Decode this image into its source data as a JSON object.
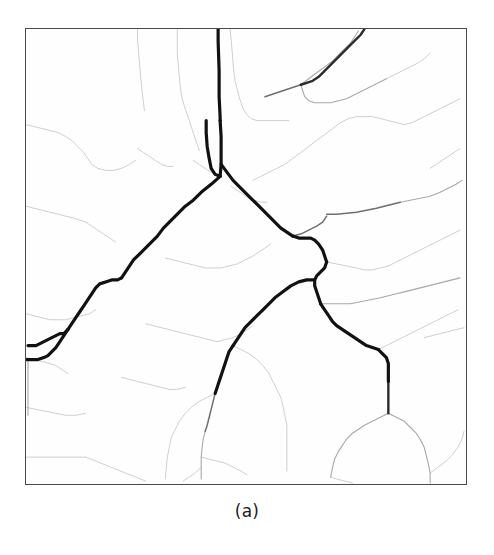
{
  "figure": {
    "caption": "(a)",
    "panel_label": "drainage-network-map",
    "background_color": "#ffffff",
    "panel_background_color": "#fefefe",
    "frame_color": "#4a4a4a",
    "frame": {
      "x": 25,
      "y": 28,
      "width": 442,
      "height": 457
    }
  },
  "chart_data": {
    "type": "diagram",
    "title": "",
    "subtitle": "",
    "xlabel": "",
    "ylabel": "",
    "grid": false,
    "legend": null,
    "viewbox": {
      "width": 442,
      "height": 457
    },
    "stroke_classes": [
      {
        "name": "trunk",
        "color": "#111111",
        "width": 3.2,
        "order": "main-channel"
      },
      {
        "name": "major",
        "color": "#2b2b2b",
        "width": 2.4,
        "order": "secondary-channel"
      },
      {
        "name": "medium",
        "color": "#6f6f6f",
        "width": 1.5,
        "order": "tertiary-channel"
      },
      {
        "name": "minor",
        "color": "#a8a8a8",
        "width": 1.1,
        "order": "minor-tributary"
      },
      {
        "name": "faint",
        "color": "#cfcfcf",
        "width": 1.0,
        "order": "first-order-tributary"
      }
    ],
    "channels": [
      {
        "id": "trunk-upper-inlet",
        "class": "trunk",
        "points": "193,0 193,12 194,42 194,68 195,88 195,92"
      },
      {
        "id": "trunk-upper-stem",
        "class": "trunk",
        "points": "195,92 196,108 196,122 196,136 195,148"
      },
      {
        "id": "trunk-left-spur",
        "class": "trunk",
        "points": "181,92 181,104 182,118 184,130 186,140 190,146 195,148"
      },
      {
        "id": "trunk-left-descent",
        "class": "trunk",
        "points": "195,148 186,156 176,164 168,172 160,178 152,186 144,194 138,200 132,208 126,214 120,220 114,226 108,232 104,238 100,244 96,250"
      },
      {
        "id": "trunk-left-step",
        "class": "trunk",
        "points": "96,250 92,252 86,252 80,254 74,256 70,260 66,266 62,272 58,278 54,284 50,290 46,296 42,302"
      },
      {
        "id": "trunk-left-mid",
        "class": "trunk",
        "points": "42,302 38,306 34,306 30,308 26,310 22,312 18,314 14,316 10,318 6,318 2,318"
      },
      {
        "id": "trunk-left-lower",
        "class": "trunk",
        "points": "42,302 38,308 34,314 30,320 26,324 22,328 18,330 12,332 6,332 1,332"
      },
      {
        "id": "trunk-outlet-edge",
        "class": "minor",
        "points": "2,332 2,344 2,356 2,368 2,378 2,388"
      },
      {
        "id": "trunk-right-descent",
        "class": "trunk",
        "points": "196,136 202,144 208,152 214,158 220,164 226,170 232,176 238,182 244,188 250,194 256,200 262,204 268,208"
      },
      {
        "id": "trunk-right-junction",
        "class": "trunk",
        "points": "268,208 274,210 280,210 286,210 290,212 294,216 298,222 300,228 302,234"
      },
      {
        "id": "trunk-center-knot",
        "class": "trunk",
        "points": "302,234 300,240 296,244 292,248 290,252 290,258 292,264 294,270 296,276"
      },
      {
        "id": "trunk-branch-southwest",
        "class": "trunk",
        "points": "290,252 282,252 274,254 266,258 258,264 250,270 244,276 238,282 232,288 226,294 220,300 216,306 212,312 208,318"
      },
      {
        "id": "trunk-branch-sw-lower",
        "class": "trunk",
        "points": "208,318 204,324 202,330 200,336 198,342 196,348 194,354 192,360 190,366"
      },
      {
        "id": "trunk-sw-fade",
        "class": "medium",
        "points": "190,366 188,374 186,382 184,390 182,398 180,404"
      },
      {
        "id": "trunk-sw-fade2",
        "class": "minor",
        "points": "180,404 178,412 177,420 176,430 176,440 176,452"
      },
      {
        "id": "trunk-branch-southeast",
        "class": "trunk",
        "points": "296,276 300,282 304,288 308,294 312,298 318,302 324,306 330,310 336,314 342,318 348,320 354,322"
      },
      {
        "id": "trunk-se-step",
        "class": "trunk",
        "points": "354,322 358,326 362,330 364,336 364,342 364,348 364,354"
      },
      {
        "id": "trunk-se-lower",
        "class": "major",
        "points": "364,354 364,362 364,370 364,378 364,386"
      },
      {
        "id": "se-fork-left",
        "class": "minor",
        "points": "364,386 356,390 348,394 340,398 334,402 328,406 322,412 318,418 314,424 310,432 308,440 306,450"
      },
      {
        "id": "se-fork-right",
        "class": "minor",
        "points": "364,386 372,390 380,394 386,400 392,406 396,412 400,420 402,428 404,436 406,446 406,456"
      },
      {
        "id": "ne-dark-inlet",
        "class": "major",
        "points": "340,0 336,6 330,12 324,18 318,24 312,30 306,36 300,42 294,48 288,52 282,54 276,56"
      },
      {
        "id": "ne-dark-continue",
        "class": "medium",
        "points": "276,56 270,58 264,60 258,62 252,64 246,66 240,68"
      },
      {
        "id": "ne-branch-up-right",
        "class": "minor",
        "points": "276,56 284,50 292,44 300,38 308,32 314,26 320,20 326,14 330,8 334,2"
      },
      {
        "id": "ne-branch-down",
        "class": "minor",
        "points": "276,56 278,62 280,68 284,72 290,74 298,74 306,74 314,72 322,70 330,66 338,62 346,58 354,54 362,50"
      },
      {
        "id": "ne-branch-far-right",
        "class": "faint",
        "points": "362,50 370,46 378,42 386,38 394,34 400,30 406,24"
      },
      {
        "id": "top-center-tributary",
        "class": "faint",
        "points": "205,0 206,10 207,22 208,34 209,44 210,52 212,60 214,68 216,74 218,80"
      },
      {
        "id": "top-center-trib2",
        "class": "faint",
        "points": "218,80 222,86 226,90 232,92 240,92 248,92 256,92 264,92"
      },
      {
        "id": "upper-left-trib-a",
        "class": "faint",
        "points": "152,0 152,12 152,24 153,36 154,48 155,58 156,66 158,74 160,80 162,86 164,92 166,98 168,104 170,110 172,116 174,122"
      },
      {
        "id": "upper-left-trib-b",
        "class": "faint",
        "points": "112,0 112,10 113,22 114,34 115,46 116,56 117,66 118,74 119,82"
      },
      {
        "id": "upper-left-trib-c",
        "class": "faint",
        "points": "0,96 8,98 16,100 24,102 32,104 40,108 46,112 52,118 58,124 62,130 66,136"
      },
      {
        "id": "upper-left-trib-d",
        "class": "faint",
        "points": "66,136 72,140 80,142 88,142 96,140 104,136 110,132"
      },
      {
        "id": "left-mid-trib-a",
        "class": "faint",
        "points": "0,178 8,180 16,182 24,184 32,186 40,188 48,190 54,192 60,194"
      },
      {
        "id": "left-mid-trib-b",
        "class": "faint",
        "points": "60,194 66,198 72,202 78,206 84,210 90,214"
      },
      {
        "id": "left-lower-trib-a",
        "class": "faint",
        "points": "0,286 8,288 16,290 24,292 32,292 40,292 48,290 56,288 64,286 70,282"
      },
      {
        "id": "left-lower-trib-b",
        "class": "faint",
        "points": "0,330 8,332 16,334 24,336 30,338 36,342 42,346"
      },
      {
        "id": "left-bottom-trib",
        "class": "faint",
        "points": "0,380 10,382 20,384 30,386 40,388 50,388 60,386"
      },
      {
        "id": "left-bottom-trib2",
        "class": "faint",
        "points": "0,430 12,430 24,430 36,430 48,430 60,430"
      },
      {
        "id": "center-trib-a",
        "class": "faint",
        "points": "112,120 118,124 124,128 130,132 136,136 142,138 148,138"
      },
      {
        "id": "center-trib-b",
        "class": "faint",
        "points": "168,132 174,136 180,140 186,144 192,146"
      },
      {
        "id": "center-trib-c",
        "class": "faint",
        "points": "206,158 212,162 218,166 224,170 230,172 236,174 242,174"
      },
      {
        "id": "center-trib-d",
        "class": "faint",
        "points": "140,230 148,232 156,234 164,236 172,238 180,240 188,240 196,240"
      },
      {
        "id": "center-trib-e",
        "class": "faint",
        "points": "196,240 204,238 212,236 220,232 228,228 234,224 240,220 246,216"
      },
      {
        "id": "center-bowl-a",
        "class": "faint",
        "points": "120,296 128,298 136,300 144,302 152,304 160,306 168,308 176,310 184,312 192,314"
      },
      {
        "id": "center-bowl-b",
        "class": "faint",
        "points": "192,314 200,312 208,310 216,306 222,302 228,298"
      },
      {
        "id": "center-lower-trib",
        "class": "faint",
        "points": "96,350 104,352 112,354 120,356 128,358 136,360 144,362 152,362 160,360"
      },
      {
        "id": "mid-right-horizontal-a",
        "class": "medium",
        "points": "302,186 312,186 322,185 332,184 342,182 352,180 360,178 368,176 376,174"
      },
      {
        "id": "mid-right-horizontal-b",
        "class": "minor",
        "points": "376,174 386,172 396,170 406,168 416,164 424,160 432,156 438,152"
      },
      {
        "id": "mid-right-horizontal-c",
        "class": "medium",
        "points": "268,208 276,206 284,202 292,198 298,194 302,188"
      },
      {
        "id": "mid-right-trib-a",
        "class": "faint",
        "points": "228,152 236,148 244,144 252,140 260,136 268,130 276,124 284,118 292,112 300,106 308,100 316,94"
      },
      {
        "id": "mid-right-trib-b",
        "class": "faint",
        "points": "316,94 324,90 332,88 340,88 348,88 356,90 364,92 372,94 380,96"
      },
      {
        "id": "mid-right-trib-c",
        "class": "faint",
        "points": "380,96 388,94 396,90 404,86 412,82 420,78 428,74 436,70"
      },
      {
        "id": "mid-right-trib-d",
        "class": "faint",
        "points": "302,234 312,236 322,238 332,240 340,242 348,242 356,240 364,238"
      },
      {
        "id": "mid-right-trib-e",
        "class": "faint",
        "points": "364,238 372,234 380,230 388,226 396,222 404,218 412,214 420,210 428,206 436,202"
      },
      {
        "id": "right-trib-horizontal",
        "class": "minor",
        "points": "296,276 306,276 316,276 326,276 336,274 346,272 356,270 364,268 372,266 380,264 388,262 396,260 404,258 412,256 420,254 428,252 436,250"
      },
      {
        "id": "right-lower-trib-a",
        "class": "faint",
        "points": "354,322 362,318 370,314 378,310 386,306 394,302 402,298 410,294 418,290 426,286 434,282"
      },
      {
        "id": "right-lower-trib-b",
        "class": "faint",
        "points": "406,446 414,440 422,434 428,428 434,420 438,412 440,404"
      },
      {
        "id": "bottom-center-trib-a",
        "class": "faint",
        "points": "176,440 170,446 164,450 158,454"
      },
      {
        "id": "bottom-center-trib-b",
        "class": "faint",
        "points": "176,430 184,432 192,434 200,436 208,440 216,444 222,448"
      },
      {
        "id": "bottom-left-trib",
        "class": "faint",
        "points": "60,430 70,434 80,438 90,442 100,446 110,450 120,454"
      },
      {
        "id": "bottom-right-trib",
        "class": "faint",
        "points": "306,450 312,452 320,454 328,456"
      },
      {
        "id": "lower-mid-fan-a",
        "class": "faint",
        "points": "208,318 216,322 224,326 232,332 238,338 244,346 248,354 252,362 256,370 258,378 260,388 262,398 262,408 262,420 262,432 262,444"
      },
      {
        "id": "lower-mid-fan-b",
        "class": "faint",
        "points": "190,366 182,370 174,374 166,380 160,386 154,394 150,402 146,410 144,420 142,430 141,440 140,452"
      },
      {
        "id": "far-right-edge-trib",
        "class": "faint",
        "points": "436,120 430,124 424,128 418,132 412,136 406,140"
      },
      {
        "id": "far-right-edge-trib2",
        "class": "faint",
        "points": "440,300 432,302 424,304 416,306 408,308 400,310"
      }
    ]
  }
}
